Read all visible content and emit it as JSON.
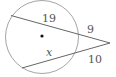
{
  "diagram": {
    "type": "circle-two-secants",
    "circle": {
      "cx": 42,
      "cy": 37,
      "r": 37,
      "stroke": "#9a9a9a"
    },
    "center_dot": {
      "x": 42,
      "y": 36
    },
    "external_point": {
      "x": 110,
      "y": 43
    },
    "secants": [
      {
        "name": "upper",
        "far": {
          "x": 11,
          "y": 15
        },
        "near": {
          "x": 79,
          "y": 33
        }
      },
      {
        "name": "lower",
        "far": {
          "x": 22,
          "y": 68
        },
        "near": {
          "x": 77,
          "y": 52
        }
      }
    ],
    "labels": {
      "upper_internal": "19",
      "upper_external": "9",
      "lower_internal": "x",
      "lower_external": "10"
    },
    "line_color": "#666666"
  }
}
